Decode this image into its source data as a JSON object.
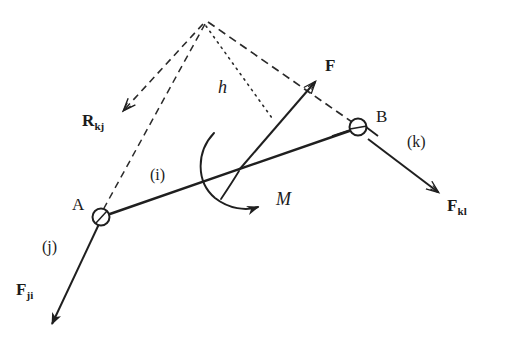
{
  "figure": {
    "type": "free-body-diagram",
    "ink_color": "#1f1f1f",
    "background_color": "#ffffff"
  },
  "joints": [
    {
      "id": "A",
      "label": "A",
      "label_x": 72,
      "label_y": 196,
      "cx": 101,
      "cy": 217,
      "r": 8
    },
    {
      "id": "B",
      "label": "B",
      "label_x": 376,
      "label_y": 108,
      "cx": 358,
      "cy": 127,
      "r": 8
    }
  ],
  "links": [
    {
      "id": "i",
      "label": "(i)",
      "label_x": 150,
      "label_y": 167
    },
    {
      "id": "j",
      "label": "(j)",
      "label_x": 42,
      "label_y": 239
    },
    {
      "id": "k",
      "label": "(k)",
      "label_x": 407,
      "label_y": 134
    }
  ],
  "vectors": [
    {
      "id": "F",
      "label": "F",
      "subscript": "",
      "label_x": 325,
      "label_y": 57,
      "tail_x": 238,
      "tail_y": 170,
      "head_x": 318,
      "head_y": 78,
      "style": "solid"
    },
    {
      "id": "R_kj",
      "label": "R",
      "subscript": "kj",
      "label_x": 82,
      "label_y": 112,
      "tail_x": 205,
      "tail_y": 22,
      "head_x": 118,
      "head_y": 115,
      "style": "dashed"
    },
    {
      "id": "F_ji",
      "label": "F",
      "subscript": "ji",
      "label_x": 16,
      "label_y": 281,
      "tail_x": 101,
      "tail_y": 217,
      "head_x": 48,
      "head_y": 330,
      "style": "solid"
    },
    {
      "id": "F_kl",
      "label": "F",
      "subscript": "kl",
      "label_x": 447,
      "label_y": 197,
      "tail_x": 370,
      "tail_y": 140,
      "head_x": 444,
      "head_y": 196,
      "style": "solid"
    }
  ],
  "moment": {
    "id": "M",
    "label": "M",
    "label_x": 276,
    "label_y": 190,
    "arrow_head_x": 265,
    "arrow_head_y": 206,
    "sense": "counterclockwise-arc-arrow-right"
  },
  "dimension": {
    "id": "h",
    "label": "h",
    "label_x": 218,
    "label_y": 78,
    "from_x": 205,
    "from_y": 22,
    "to_x": 272,
    "to_y": 118,
    "style": "dotted",
    "meaning": "moment arm"
  },
  "geometry": {
    "apex_x": 205,
    "apex_y": 22,
    "link_ab": {
      "x1": 101,
      "y1": 217,
      "x2": 358,
      "y2": 127
    }
  }
}
